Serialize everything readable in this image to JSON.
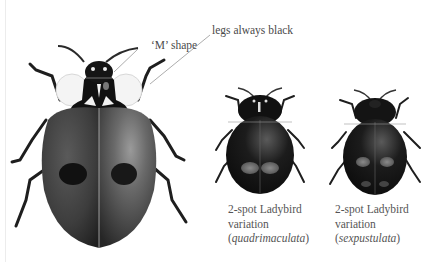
{
  "figure": {
    "annotations": [
      {
        "id": "m-shape",
        "text": "‘M’ shape"
      },
      {
        "id": "legs",
        "text": "legs always black"
      }
    ],
    "specimens": [
      {
        "id": "main",
        "description": "2-spot Ladybird (melanic form), large illustration"
      },
      {
        "id": "quadrimaculata",
        "line1": "2-spot Ladybird",
        "line2": "variation",
        "open": "(",
        "latin": "quadrimaculata",
        "close": ")"
      },
      {
        "id": "sexpustulata",
        "line1": "2-spot Ladybird",
        "line2": "variation",
        "open": "(",
        "latin": "sexpustulata",
        "close": ")"
      }
    ]
  }
}
